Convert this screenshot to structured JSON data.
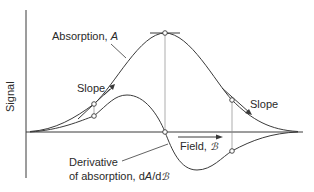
{
  "figure": {
    "y_axis_label": "Signal",
    "x_axis_label_prefix": "Field, ",
    "x_axis_symbol": "ℬ",
    "absorption_label_prefix": "Absorption, ",
    "absorption_symbol": "A",
    "slope_left_label": "Slope",
    "slope_right_label": "Slope",
    "derivative_label_line1": "Derivative",
    "derivative_label_line2_prefix": "of absorption, d",
    "derivative_symbol_A": "A",
    "derivative_slash_d": "/d",
    "derivative_symbol_B": "ℬ"
  },
  "colors": {
    "line": "#3a3a3a",
    "guide": "#8a8a8a",
    "background": "#ffffff"
  },
  "diagram_elements": {
    "curves": [
      "absorption (bell-shaped peak)",
      "derivative of absorption (positive lobe, zero crossing at peak, negative lobe)"
    ],
    "markers": [
      {
        "curve": "absorption",
        "position": "left slope"
      },
      {
        "curve": "derivative",
        "position": "left lobe"
      },
      {
        "curve": "absorption",
        "position": "peak"
      },
      {
        "curve": "derivative",
        "position": "zero crossing"
      },
      {
        "curve": "absorption",
        "position": "right slope"
      },
      {
        "curve": "derivative",
        "position": "right lobe"
      }
    ]
  }
}
